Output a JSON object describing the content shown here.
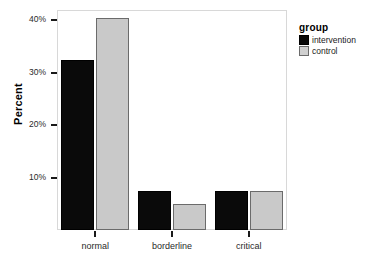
{
  "chart_data": {
    "type": "bar",
    "title": "",
    "subtitle": "",
    "xlabel": "",
    "ylabel": "Percent",
    "categories": [
      "normal",
      "borderline",
      "critical"
    ],
    "series": [
      {
        "name": "intervention",
        "color": "#0a0a0a",
        "values": [
          32.5,
          7.5,
          7.5
        ]
      },
      {
        "name": "control",
        "color": "#c9c9c9",
        "values": [
          40.5,
          5.0,
          7.5
        ]
      }
    ],
    "ylim": [
      0,
      42
    ],
    "yticks": [
      10,
      20,
      30,
      40
    ],
    "ytick_labels": [
      "10%",
      "20%",
      "30%",
      "40%"
    ],
    "grid": false,
    "legend": {
      "title": "group",
      "position": "right",
      "entries": [
        {
          "label": "intervention",
          "color": "#0a0a0a"
        },
        {
          "label": "control",
          "color": "#c9c9c9"
        }
      ]
    },
    "bar_mode": "grouped"
  }
}
